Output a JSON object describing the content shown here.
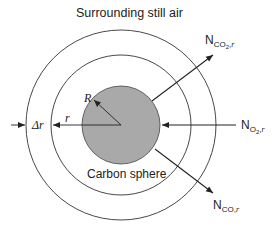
{
  "title": "Surrounding still air",
  "sphere_label": "Carbon sphere",
  "radius_label": "R",
  "r_label": "r",
  "delta_r_label": "Δr",
  "fluxes": {
    "co2": {
      "main": "N",
      "sub_species": "CO",
      "sub_digit": "2",
      "sub_dir": "r"
    },
    "o2": {
      "main": "N",
      "sub_species": "O",
      "sub_digit": "2",
      "sub_dir": "r"
    },
    "co": {
      "main": "N",
      "sub_species": "CO",
      "sub_digit": "",
      "sub_dir": "r"
    }
  },
  "colors": {
    "sphere_fill": "#a9a9a9",
    "line": "#222222",
    "background": "#ffffff"
  }
}
